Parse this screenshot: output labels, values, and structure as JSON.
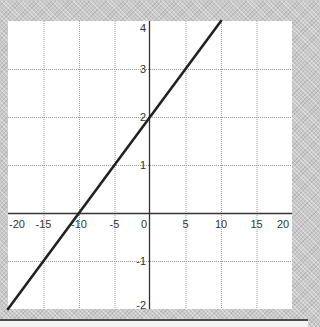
{
  "chart_data": {
    "type": "line",
    "title": "",
    "xlabel": "",
    "ylabel": "",
    "xlim": [
      -20,
      20
    ],
    "ylim": [
      -2,
      4
    ],
    "grid": true,
    "legend": null,
    "x_ticks": [
      -20,
      -15,
      -10,
      -5,
      0,
      5,
      10,
      15,
      20
    ],
    "x_tick_labels": [
      "-20",
      "-15",
      "-10",
      "-5",
      "0",
      "5",
      "10",
      "15",
      "20"
    ],
    "y_ticks": [
      -2,
      -1,
      1,
      2,
      3,
      4
    ],
    "y_tick_labels": [
      "-2",
      "-1",
      "1",
      "2",
      "3",
      "4"
    ],
    "series": [
      {
        "name": "line",
        "equation": "y = 0.2x + 2",
        "x": [
          -20,
          -15,
          -10,
          -5,
          0,
          5,
          10
        ],
        "y": [
          -2,
          -1,
          0,
          1,
          2,
          3,
          4
        ],
        "color": "#222222"
      }
    ]
  },
  "style": {
    "plot_bg": "#ffffff",
    "grid_color": "#9a9a9a",
    "axis_color": "#333333",
    "label_color": "#333333",
    "frame_bg": "#c9c9c9"
  }
}
